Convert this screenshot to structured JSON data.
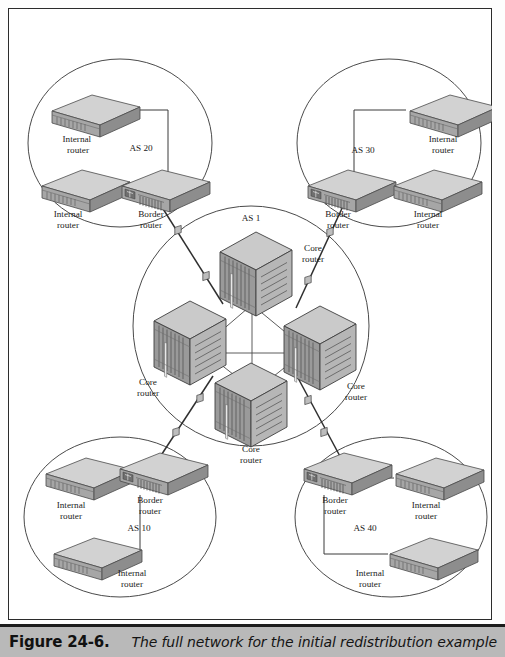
{
  "figure": {
    "caption_label": "Figure 24-6.",
    "caption_text": "The full network for the initial redistribution example"
  },
  "colors": {
    "background": "#ffffff",
    "frame_border": "#2b2b2b",
    "caption_bar": "#b9b9b9",
    "caption_rule": "#1c1c1c",
    "line": "#3a3a3a",
    "circle": "#4a4a4a",
    "device_top": "#d8d8d8",
    "device_front": "#a9a9a9",
    "device_side": "#8f8f8f",
    "core_top": "#cfcfcf",
    "core_left": "#9b9b9b",
    "core_right": "#b4b4b4"
  },
  "autonomous_systems": [
    {
      "id": "as20",
      "label": "AS 20",
      "position": "top-left",
      "label_x": 133,
      "label_y": 140,
      "circle": {
        "cx": 112,
        "cy": 135,
        "rx": 92,
        "ry": 84
      },
      "devices": [
        {
          "name": "internal-router-as20-top",
          "type": "internal",
          "label": "Internal\nrouter",
          "x": 38,
          "y": 85,
          "label_x": 70,
          "label_y": 134
        },
        {
          "name": "internal-router-as20-bottom",
          "type": "internal",
          "label": "Internal\nrouter",
          "x": 28,
          "y": 160,
          "label_x": 60,
          "label_y": 209
        },
        {
          "name": "border-router-as20",
          "type": "border",
          "label": "Border\nrouter",
          "x": 108,
          "y": 160,
          "label_x": 141,
          "label_y": 209
        }
      ]
    },
    {
      "id": "as30",
      "label": "AS 30",
      "position": "top-right",
      "label_x": 355,
      "label_y": 142,
      "circle": {
        "cx": 381,
        "cy": 135,
        "rx": 92,
        "ry": 84
      },
      "devices": [
        {
          "name": "internal-router-as30-top",
          "type": "internal",
          "label": "Internal\nrouter",
          "x": 396,
          "y": 85,
          "label_x": 433,
          "label_y": 134
        },
        {
          "name": "border-router-as30",
          "type": "border",
          "label": "Border\nrouter",
          "x": 294,
          "y": 160,
          "label_x": 330,
          "label_y": 209
        },
        {
          "name": "internal-router-as30-bottom",
          "type": "internal",
          "label": "Internal\nrouter",
          "x": 380,
          "y": 160,
          "label_x": 420,
          "label_y": 209
        }
      ]
    },
    {
      "id": "as1",
      "label": "AS 1",
      "position": "center",
      "label_x": 243,
      "label_y": 210,
      "circle": {
        "cx": 243,
        "cy": 318,
        "rx": 118,
        "ry": 120
      },
      "devices": [
        {
          "name": "core-router-top",
          "type": "core",
          "label": "Core\nrouter",
          "x": 208,
          "y": 222,
          "label_x": 300,
          "label_y": 225
        },
        {
          "name": "core-router-left",
          "type": "core",
          "label": "Core\nrouter",
          "x": 142,
          "y": 291,
          "label_x": 141,
          "label_y": 355
        },
        {
          "name": "core-router-right",
          "type": "core",
          "label": "Core\nrouter",
          "x": 272,
          "y": 296,
          "label_x": 345,
          "label_y": 358
        },
        {
          "name": "core-router-bottom",
          "type": "core",
          "label": "Core\nrouter",
          "x": 203,
          "y": 353,
          "label_x": 243,
          "label_y": 427
        }
      ]
    },
    {
      "id": "as10",
      "label": "AS 10",
      "position": "bottom-left",
      "label_x": 131,
      "label_y": 518,
      "circle": {
        "cx": 112,
        "cy": 509,
        "rx": 96,
        "ry": 80
      },
      "devices": [
        {
          "name": "internal-router-as10-top",
          "type": "internal",
          "label": "Internal\nrouter",
          "x": 32,
          "y": 448,
          "label_x": 63,
          "label_y": 497
        },
        {
          "name": "border-router-as10",
          "type": "border",
          "label": "Border\nrouter",
          "x": 106,
          "y": 443,
          "label_x": 141,
          "label_y": 492
        },
        {
          "name": "internal-router-as10-bottom",
          "type": "internal",
          "label": "Internal\nrouter",
          "x": 40,
          "y": 528,
          "label_x": 123,
          "label_y": 565
        }
      ]
    },
    {
      "id": "as40",
      "label": "AS 40",
      "position": "bottom-right",
      "label_x": 357,
      "label_y": 518,
      "circle": {
        "cx": 383,
        "cy": 509,
        "rx": 96,
        "ry": 80
      },
      "devices": [
        {
          "name": "border-router-as40",
          "type": "border",
          "label": "Border\nrouter",
          "x": 290,
          "y": 443,
          "label_x": 327,
          "label_y": 492
        },
        {
          "name": "internal-router-as40-top",
          "type": "internal",
          "label": "Internal\nrouter",
          "x": 382,
          "y": 448,
          "label_x": 416,
          "label_y": 497
        },
        {
          "name": "internal-router-as40-bottom",
          "type": "internal",
          "label": "Internal\nrouter",
          "x": 376,
          "y": 528,
          "label_x": 362,
          "label_y": 565
        }
      ]
    }
  ],
  "labels": {
    "internal_router": "Internal router",
    "border_router": "Border router",
    "core_router": "Core router"
  },
  "topology": {
    "intra_as_links": 6,
    "inter_as_links": 4,
    "core_mesh_links": 6,
    "link_marker_count": 8
  }
}
